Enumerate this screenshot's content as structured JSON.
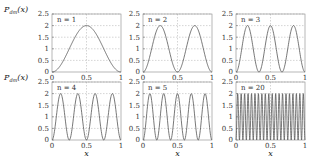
{
  "chart_data": [
    {
      "type": "line",
      "title": "",
      "annotation": "n = 1",
      "n": 1,
      "xlabel": "",
      "ylabel": "P_dm(x)",
      "xlim": [
        0,
        1
      ],
      "ylim": [
        0,
        2.5
      ],
      "xticks": [
        "0",
        "0.5",
        "1"
      ],
      "yticks": [
        "0",
        "0.5",
        "1",
        "1.5",
        "2",
        "2.5"
      ],
      "grid": true,
      "function": "2 sin^2(n*pi*x)",
      "x": [
        0,
        0.25,
        0.5,
        0.75,
        1
      ],
      "values": [
        0,
        1,
        2,
        1,
        0
      ]
    },
    {
      "type": "line",
      "title": "",
      "annotation": "n = 2",
      "n": 2,
      "xlabel": "",
      "ylabel": "",
      "xlim": [
        0,
        1
      ],
      "ylim": [
        0,
        2.5
      ],
      "xticks": [
        "0",
        "0.5",
        "1"
      ],
      "yticks": [
        "0",
        "0.5",
        "1",
        "1.5",
        "2",
        "2.5"
      ],
      "grid": true,
      "function": "2 sin^2(n*pi*x)",
      "x": [
        0,
        0.25,
        0.5,
        0.75,
        1
      ],
      "values": [
        0,
        2,
        0,
        2,
        0
      ]
    },
    {
      "type": "line",
      "title": "",
      "annotation": "n = 3",
      "n": 3,
      "xlabel": "",
      "ylabel": "",
      "xlim": [
        0,
        1
      ],
      "ylim": [
        0,
        2.5
      ],
      "xticks": [
        "0",
        "0.5",
        "1"
      ],
      "yticks": [
        "0",
        "0.5",
        "1",
        "1.5",
        "2",
        "2.5"
      ],
      "grid": true,
      "function": "2 sin^2(n*pi*x)",
      "x": [
        0,
        0.1667,
        0.3333,
        0.5,
        0.6667,
        0.8333,
        1
      ],
      "values": [
        0,
        2,
        0,
        2,
        0,
        2,
        0
      ]
    },
    {
      "type": "line",
      "title": "",
      "annotation": "n = 4",
      "n": 4,
      "xlabel": "x",
      "ylabel": "P_dm(x)",
      "xlim": [
        0,
        1
      ],
      "ylim": [
        0,
        2.5
      ],
      "xticks": [
        "0",
        "0.5",
        "1"
      ],
      "yticks": [
        "0",
        "0.5",
        "1",
        "1.5",
        "2",
        "2.5"
      ],
      "grid": true,
      "function": "2 sin^2(n*pi*x)",
      "x": [
        0,
        0.125,
        0.25,
        0.375,
        0.5,
        0.625,
        0.75,
        0.875,
        1
      ],
      "values": [
        0,
        2,
        0,
        2,
        0,
        2,
        0,
        2,
        0
      ]
    },
    {
      "type": "line",
      "title": "",
      "annotation": "n = 5",
      "n": 5,
      "xlabel": "x",
      "ylabel": "",
      "xlim": [
        0,
        1
      ],
      "ylim": [
        0,
        2.5
      ],
      "xticks": [
        "0",
        "0.5",
        "1"
      ],
      "yticks": [
        "0",
        "0.5",
        "1",
        "1.5",
        "2",
        "2.5"
      ],
      "grid": true,
      "function": "2 sin^2(n*pi*x)",
      "x": [
        0,
        0.1,
        0.2,
        0.3,
        0.4,
        0.5,
        0.6,
        0.7,
        0.8,
        0.9,
        1
      ],
      "values": [
        0,
        2,
        0,
        2,
        0,
        2,
        0,
        2,
        0,
        2,
        0
      ]
    },
    {
      "type": "line",
      "title": "",
      "annotation": "n = 20",
      "n": 20,
      "xlabel": "x",
      "ylabel": "",
      "xlim": [
        0,
        1
      ],
      "ylim": [
        0,
        2.5
      ],
      "xticks": [
        "0",
        "0.5",
        "1"
      ],
      "yticks": [
        "0",
        "0.5",
        "1",
        "1.5",
        "2",
        "2.5"
      ],
      "grid": true,
      "function": "2 sin^2(n*pi*x)",
      "peaks": 20,
      "values_range": [
        0,
        2
      ]
    }
  ],
  "figure": {
    "ylabel_main": "P",
    "ylabel_sub": "dm",
    "ylabel_arg": "(x)",
    "xlabel": "x",
    "line_color": "#555555",
    "grid_color": "#aaaaaa"
  }
}
